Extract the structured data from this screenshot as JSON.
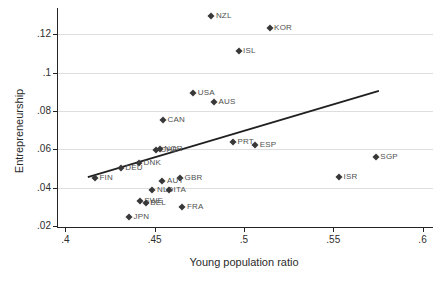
{
  "chart_data": {
    "type": "scatter",
    "title": "",
    "xlabel": "Young population ratio",
    "ylabel": "Entrepreneurship",
    "x_range": [
      0.3953,
      0.6053
    ],
    "y_range": [
      0.0195,
      0.1337
    ],
    "x_ticks": [
      {
        "v": 0.4,
        "label": ".4"
      },
      {
        "v": 0.45,
        "label": ".45"
      },
      {
        "v": 0.5,
        "label": ".5"
      },
      {
        "v": 0.55,
        "label": ".55"
      },
      {
        "v": 0.6,
        "label": ".6"
      }
    ],
    "y_ticks": [
      {
        "v": 0.02,
        "label": ".02"
      },
      {
        "v": 0.04,
        "label": ".04"
      },
      {
        "v": 0.06,
        "label": ".06"
      },
      {
        "v": 0.08,
        "label": ".08"
      },
      {
        "v": 0.1,
        "label": ".1"
      },
      {
        "v": 0.12,
        "label": ".12"
      }
    ],
    "gridline_values": [
      0.04,
      0.06,
      0.08,
      0.1,
      0.12
    ],
    "grid": "horizontal",
    "legend": "none",
    "marker_shape": "diamond",
    "points": [
      {
        "code": "NZL",
        "x": 0.4812,
        "y": 0.1294
      },
      {
        "code": "KOR",
        "x": 0.5138,
        "y": 0.1233
      },
      {
        "code": "ISL",
        "x": 0.4964,
        "y": 0.1113
      },
      {
        "code": "USA",
        "x": 0.4711,
        "y": 0.0896
      },
      {
        "code": "AUS",
        "x": 0.4827,
        "y": 0.0848
      },
      {
        "code": "CAN",
        "x": 0.4541,
        "y": 0.0753
      },
      {
        "code": "PRT",
        "x": 0.4933,
        "y": 0.0637
      },
      {
        "code": "ESP",
        "x": 0.5057,
        "y": 0.0624
      },
      {
        "code": "CHE",
        "x": 0.45,
        "y": 0.0596
      },
      {
        "code": "NOR",
        "x": 0.4523,
        "y": 0.0601
      },
      {
        "code": "SGP",
        "x": 0.5733,
        "y": 0.0558
      },
      {
        "code": "DNK",
        "x": 0.4407,
        "y": 0.0527
      },
      {
        "code": "DEU",
        "x": 0.4304,
        "y": 0.0501
      },
      {
        "code": "ISR",
        "x": 0.5527,
        "y": 0.0457
      },
      {
        "code": "FIN",
        "x": 0.416,
        "y": 0.045
      },
      {
        "code": "GBR",
        "x": 0.4636,
        "y": 0.0449
      },
      {
        "code": "AUT",
        "x": 0.4538,
        "y": 0.0436
      },
      {
        "code": "NLD",
        "x": 0.4482,
        "y": 0.0388
      },
      {
        "code": "ITA",
        "x": 0.4575,
        "y": 0.0388
      },
      {
        "code": "SWE",
        "x": 0.4411,
        "y": 0.0332
      },
      {
        "code": "BEL",
        "x": 0.4444,
        "y": 0.0318
      },
      {
        "code": "FRA",
        "x": 0.465,
        "y": 0.0301
      },
      {
        "code": "JPN",
        "x": 0.4351,
        "y": 0.0249
      }
    ],
    "trend_line": {
      "x1": 0.412,
      "y1": 0.0455,
      "x2": 0.575,
      "y2": 0.0905
    },
    "colors": {
      "background": "#ffffff",
      "marker": "#383838",
      "point_label": "#4f4f4f",
      "grid": "#dedede",
      "axis": "#242424",
      "trend": "#202020",
      "tick_text": "#2e2e2e",
      "axis_title_text": "#2b2b2b"
    }
  }
}
